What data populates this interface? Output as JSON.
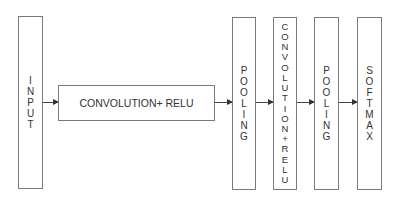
{
  "diagram": {
    "title": "",
    "nodes": [
      {
        "id": "input",
        "label": "INPUT",
        "orientation": "vertical"
      },
      {
        "id": "conv1",
        "label": "CONVOLUTION+ RELU",
        "orientation": "horizontal"
      },
      {
        "id": "pool1",
        "label": "POOLING",
        "orientation": "vertical"
      },
      {
        "id": "conv2",
        "label": "CONVOLUTION+ RELU",
        "orientation": "vertical"
      },
      {
        "id": "pool2",
        "label": "POOLING",
        "orientation": "vertical"
      },
      {
        "id": "softmax",
        "label": "SOFTMAX",
        "orientation": "vertical"
      }
    ],
    "edges": [
      {
        "from": "input",
        "to": "conv1"
      },
      {
        "from": "conv1",
        "to": "pool1"
      },
      {
        "from": "pool1",
        "to": "conv2"
      },
      {
        "from": "conv2",
        "to": "pool2"
      },
      {
        "from": "pool2",
        "to": "softmax"
      }
    ],
    "colors": {
      "border": "#7a7a7a",
      "text": "#333333",
      "arrow": "#333333",
      "background": "#ffffff"
    }
  }
}
